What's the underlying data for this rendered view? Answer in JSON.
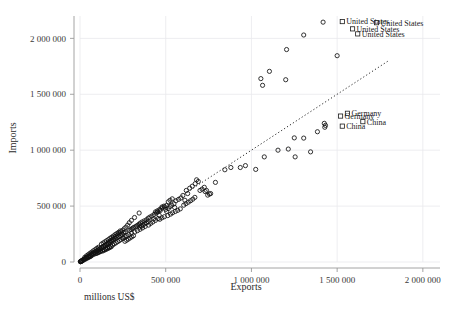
{
  "chart_data": {
    "type": "scatter",
    "title": "",
    "xlabel": "Exports",
    "ylabel": "Imports",
    "footnote": "millions US$",
    "units": "millions US$",
    "xlim": [
      0,
      2100000
    ],
    "ylim": [
      0,
      2200000
    ],
    "xticks": [
      0,
      500000,
      1000000,
      1500000,
      2000000
    ],
    "yticks": [
      0,
      500000,
      1000000,
      1500000,
      2000000
    ],
    "xtick_labels": [
      "0",
      "500 000",
      "1 000 000",
      "1 500 000",
      "2 000 000"
    ],
    "ytick_labels": [
      "0",
      "500 000",
      "1 000 000",
      "1 500 000",
      "2 000 000"
    ],
    "grid": true,
    "grid_axis": "both",
    "legend": null,
    "marker": "open-circle",
    "reference_line": {
      "type": "dotted-diagonal",
      "x": [
        250000,
        1800000
      ],
      "y": [
        250000,
        1800000
      ],
      "style": "dotted"
    },
    "annotations": [
      {
        "label": "United States",
        "x": 1530000,
        "y": 2150000
      },
      {
        "label": "United States",
        "x": 1730000,
        "y": 2140000
      },
      {
        "label": "United States",
        "x": 1590000,
        "y": 2085000
      },
      {
        "label": "United States",
        "x": 1620000,
        "y": 2040000
      },
      {
        "label": "Germany",
        "x": 1560000,
        "y": 1330000
      },
      {
        "label": "Germany",
        "x": 1520000,
        "y": 1305000
      },
      {
        "label": "China",
        "x": 1650000,
        "y": 1255000
      },
      {
        "label": "China",
        "x": 1530000,
        "y": 1215000
      }
    ],
    "points": [
      [
        1418000,
        2145000
      ],
      [
        1305000,
        2030000
      ],
      [
        1205000,
        1900000
      ],
      [
        1500000,
        1845000
      ],
      [
        1105000,
        1705000
      ],
      [
        1055000,
        1640000
      ],
      [
        1200000,
        1630000
      ],
      [
        1065000,
        1580000
      ],
      [
        1425000,
        1240000
      ],
      [
        1432000,
        1222000
      ],
      [
        1428000,
        1205000
      ],
      [
        1385000,
        1165000
      ],
      [
        1250000,
        1110000
      ],
      [
        1305000,
        1108000
      ],
      [
        1155000,
        1000000
      ],
      [
        1215000,
        1010000
      ],
      [
        1345000,
        985000
      ],
      [
        1255000,
        940000
      ],
      [
        1075000,
        940000
      ],
      [
        1025000,
        828000
      ],
      [
        935000,
        845000
      ],
      [
        965000,
        862000
      ],
      [
        880000,
        845000
      ],
      [
        845000,
        825000
      ],
      [
        790000,
        712000
      ],
      [
        700000,
        640000
      ],
      [
        730000,
        630000
      ],
      [
        755000,
        608000
      ],
      [
        680000,
        735000
      ],
      [
        690000,
        720000
      ],
      [
        672000,
        700000
      ],
      [
        655000,
        678000
      ],
      [
        640000,
        660000
      ],
      [
        620000,
        640000
      ],
      [
        628000,
        612000
      ],
      [
        600000,
        595000
      ],
      [
        588000,
        572000
      ],
      [
        612000,
        552000
      ],
      [
        575000,
        560000
      ],
      [
        560000,
        548000
      ],
      [
        548000,
        520000
      ],
      [
        535000,
        508000
      ],
      [
        525000,
        495000
      ],
      [
        552000,
        488000
      ],
      [
        515000,
        478000
      ],
      [
        500000,
        470000
      ],
      [
        490000,
        500000
      ],
      [
        478000,
        492000
      ],
      [
        468000,
        460000
      ],
      [
        505000,
        452000
      ],
      [
        455000,
        448000
      ],
      [
        445000,
        438000
      ],
      [
        432000,
        425000
      ],
      [
        462000,
        418000
      ],
      [
        420000,
        412000
      ],
      [
        408000,
        402000
      ],
      [
        398000,
        392000
      ],
      [
        430000,
        385000
      ],
      [
        388000,
        378000
      ],
      [
        375000,
        368000
      ],
      [
        362000,
        358000
      ],
      [
        352000,
        348000
      ],
      [
        345000,
        338000
      ],
      [
        338000,
        330000
      ],
      [
        330000,
        322000
      ],
      [
        322000,
        315000
      ],
      [
        312000,
        308000
      ],
      [
        305000,
        300000
      ],
      [
        298000,
        292000
      ],
      [
        290000,
        285000
      ],
      [
        345000,
        438000
      ],
      [
        318000,
        398000
      ],
      [
        300000,
        372000
      ],
      [
        288000,
        352000
      ],
      [
        278000,
        330000
      ],
      [
        268000,
        312000
      ],
      [
        258000,
        298000
      ],
      [
        248000,
        282000
      ],
      [
        238000,
        268000
      ],
      [
        228000,
        252000
      ],
      [
        218000,
        240000
      ],
      [
        208000,
        228000
      ],
      [
        198000,
        215000
      ],
      [
        188000,
        202000
      ],
      [
        178000,
        190000
      ],
      [
        168000,
        178000
      ],
      [
        158000,
        165000
      ],
      [
        148000,
        152000
      ],
      [
        138000,
        140000
      ],
      [
        128000,
        128000
      ],
      [
        118000,
        118000
      ],
      [
        108000,
        108000
      ],
      [
        98000,
        98000
      ],
      [
        88000,
        88000
      ],
      [
        78000,
        78000
      ],
      [
        68000,
        68000
      ],
      [
        58000,
        58000
      ],
      [
        48000,
        48000
      ],
      [
        38000,
        40000
      ],
      [
        28000,
        30000
      ],
      [
        18000,
        20000
      ],
      [
        12000,
        14000
      ],
      [
        8000,
        9000
      ],
      [
        5000,
        6000
      ],
      [
        3000,
        4000
      ],
      [
        2000,
        2500
      ],
      [
        265000,
        270000
      ],
      [
        255000,
        262000
      ],
      [
        245000,
        250000
      ],
      [
        235000,
        238000
      ],
      [
        225000,
        228000
      ],
      [
        215000,
        218000
      ],
      [
        205000,
        208000
      ],
      [
        195000,
        198000
      ],
      [
        185000,
        188000
      ],
      [
        175000,
        178000
      ],
      [
        165000,
        168000
      ],
      [
        155000,
        158000
      ],
      [
        145000,
        148000
      ],
      [
        135000,
        138000
      ],
      [
        125000,
        128000
      ],
      [
        115000,
        118000
      ],
      [
        105000,
        108000
      ],
      [
        95000,
        98000
      ],
      [
        85000,
        88000
      ],
      [
        75000,
        78000
      ],
      [
        65000,
        68000
      ],
      [
        55000,
        58000
      ],
      [
        45000,
        48000
      ],
      [
        35000,
        38000
      ],
      [
        250000,
        212000
      ],
      [
        240000,
        202000
      ],
      [
        230000,
        192000
      ],
      [
        220000,
        182000
      ],
      [
        210000,
        172000
      ],
      [
        200000,
        162000
      ],
      [
        190000,
        152000
      ],
      [
        180000,
        142000
      ],
      [
        170000,
        135000
      ],
      [
        160000,
        128000
      ],
      [
        150000,
        120000
      ],
      [
        140000,
        112000
      ],
      [
        130000,
        105000
      ],
      [
        120000,
        98000
      ],
      [
        110000,
        90000
      ],
      [
        100000,
        82000
      ],
      [
        90000,
        75000
      ],
      [
        80000,
        68000
      ],
      [
        70000,
        60000
      ],
      [
        60000,
        52000
      ],
      [
        50000,
        45000
      ],
      [
        40000,
        38000
      ],
      [
        30000,
        30000
      ],
      [
        20000,
        22000
      ],
      [
        400000,
        330000
      ],
      [
        380000,
        318000
      ],
      [
        365000,
        305000
      ],
      [
        350000,
        292000
      ],
      [
        335000,
        280000
      ],
      [
        320000,
        268000
      ],
      [
        412000,
        345000
      ],
      [
        425000,
        358000
      ],
      [
        440000,
        372000
      ],
      [
        455000,
        388000
      ],
      [
        300000,
        258000
      ],
      [
        285000,
        245000
      ],
      [
        272000,
        235000
      ],
      [
        262000,
        225000
      ],
      [
        252000,
        215000
      ],
      [
        492000,
        405000
      ],
      [
        478000,
        395000
      ],
      [
        465000,
        382000
      ],
      [
        512000,
        415000
      ],
      [
        528000,
        428000
      ],
      [
        540000,
        440000
      ],
      [
        556000,
        452000
      ],
      [
        570000,
        462000
      ],
      [
        585000,
        475000
      ],
      [
        118000,
        92000
      ],
      [
        108000,
        85000
      ],
      [
        98000,
        78000
      ],
      [
        132000,
        98000
      ],
      [
        142000,
        105000
      ],
      [
        152000,
        112000
      ],
      [
        162000,
        120000
      ],
      [
        172000,
        128000
      ],
      [
        182000,
        136000
      ],
      [
        62000,
        50000
      ],
      [
        52000,
        42000
      ],
      [
        42000,
        34000
      ],
      [
        32000,
        26000
      ],
      [
        22000,
        18000
      ],
      [
        15000,
        12000
      ],
      [
        10000,
        8000
      ],
      [
        6000,
        5000
      ],
      [
        4000,
        3000
      ],
      [
        215000,
        255000
      ],
      [
        205000,
        245000
      ],
      [
        225000,
        265000
      ],
      [
        235000,
        278000
      ],
      [
        195000,
        232000
      ],
      [
        185000,
        222000
      ],
      [
        175000,
        212000
      ],
      [
        165000,
        200000
      ],
      [
        155000,
        190000
      ],
      [
        145000,
        180000
      ],
      [
        135000,
        170000
      ],
      [
        125000,
        160000
      ],
      [
        605000,
        508000
      ],
      [
        618000,
        522000
      ],
      [
        632000,
        535000
      ],
      [
        645000,
        548000
      ],
      [
        658000,
        562000
      ],
      [
        670000,
        578000
      ],
      [
        515000,
        538000
      ],
      [
        525000,
        552000
      ],
      [
        538000,
        565000
      ],
      [
        348000,
        312000
      ],
      [
        358000,
        322000
      ],
      [
        368000,
        332000
      ],
      [
        378000,
        342000
      ],
      [
        388000,
        352000
      ],
      [
        398000,
        362000
      ],
      [
        88000,
        110000
      ],
      [
        78000,
        100000
      ],
      [
        98000,
        122000
      ],
      [
        108000,
        132000
      ],
      [
        68000,
        88000
      ],
      [
        58000,
        78000
      ],
      [
        48000,
        66000
      ],
      [
        38000,
        55000
      ],
      [
        28000,
        42000
      ],
      [
        440000,
        448000
      ],
      [
        452000,
        458000
      ],
      [
        465000,
        470000
      ],
      [
        478000,
        482000
      ],
      [
        492000,
        492000
      ],
      [
        505000,
        505000
      ],
      [
        262000,
        185000
      ],
      [
        272000,
        195000
      ],
      [
        282000,
        205000
      ],
      [
        292000,
        215000
      ],
      [
        302000,
        225000
      ],
      [
        312000,
        235000
      ],
      [
        745000,
        598000
      ],
      [
        762000,
        612000
      ],
      [
        712000,
        652000
      ],
      [
        725000,
        668000
      ],
      [
        738000,
        640000
      ]
    ]
  },
  "axes": {
    "x_title": "Exports",
    "y_title": "Imports"
  }
}
